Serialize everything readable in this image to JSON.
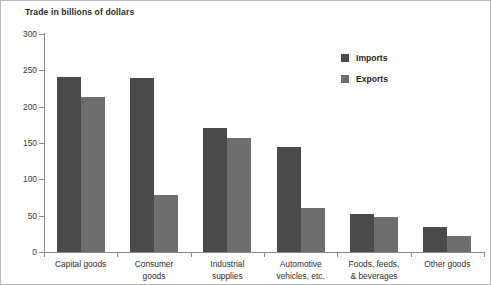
{
  "chart_data": {
    "type": "bar",
    "title": "Trade in billions of dollars",
    "xlabel": "",
    "ylabel": "",
    "ylim": [
      0,
      300
    ],
    "yticks": [
      0,
      50,
      100,
      150,
      200,
      250,
      300
    ],
    "ytick_labels": [
      "0",
      "50",
      "100",
      "150",
      "200",
      "250",
      "300"
    ],
    "grid": false,
    "legend_position": "upper-right-inside",
    "categories": [
      "Capital goods",
      "Consumer goods",
      "Industrial supplies",
      "Automotive vehicles, etc.",
      "Foods, feeds, & beverages",
      "Other goods"
    ],
    "category_label_lines": [
      [
        "Capital goods"
      ],
      [
        "Consumer",
        "goods"
      ],
      [
        "Industrial",
        "supplies"
      ],
      [
        "Automotive",
        "vehicles, etc."
      ],
      [
        "Foods, feeds,",
        "& beverages"
      ],
      [
        "Other goods"
      ]
    ],
    "series": [
      {
        "name": "Imports",
        "color": "#4a4a4a",
        "values": [
          241,
          239,
          171,
          144,
          53,
          34
        ]
      },
      {
        "name": "Exports",
        "color": "#6e6e6e",
        "values": [
          214,
          79,
          157,
          61,
          48,
          22
        ]
      }
    ]
  }
}
